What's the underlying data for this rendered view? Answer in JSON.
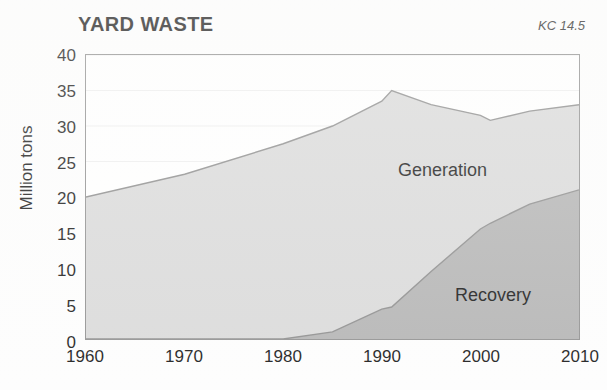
{
  "title": "YARD WASTE",
  "corner_code": "KC 14.5",
  "labels": {
    "generation": "Generation",
    "recovery": "Recovery"
  },
  "colors": {
    "generation_fill": "#d9d9d9",
    "recovery_fill": "#b2b2b2",
    "axis": "#8d8d8d",
    "gridline": "#eeeeee",
    "text": "#111111",
    "background": "#ffffff"
  },
  "chart_data": {
    "type": "area",
    "title": "YARD WASTE",
    "xlabel": "",
    "ylabel": "Million tons",
    "xlim": [
      1960,
      2010
    ],
    "ylim": [
      0,
      40
    ],
    "xticks": [
      1960,
      1970,
      1980,
      1990,
      2000,
      2010
    ],
    "yticks": [
      0,
      5,
      10,
      15,
      20,
      25,
      30,
      35,
      40
    ],
    "grid": true,
    "legend": "inline-labels",
    "x": [
      1960,
      1970,
      1980,
      1985,
      1990,
      1991,
      1995,
      2000,
      2001,
      2005,
      2010
    ],
    "series": [
      {
        "name": "Generation",
        "values": [
          20.0,
          23.2,
          27.5,
          30.0,
          33.5,
          35.0,
          33.0,
          31.5,
          30.8,
          32.1,
          33.0
        ]
      },
      {
        "name": "Recovery",
        "values": [
          0.0,
          0.0,
          0.0,
          1.0,
          4.2,
          4.5,
          9.5,
          15.5,
          16.3,
          19.0,
          21.0
        ]
      }
    ]
  },
  "yticklabels": [
    "40",
    "35",
    "30",
    "25",
    "20",
    "15",
    "10",
    "5",
    "0"
  ],
  "xticklabels": [
    "1960",
    "1970",
    "1980",
    "1990",
    "2000",
    "2010"
  ]
}
